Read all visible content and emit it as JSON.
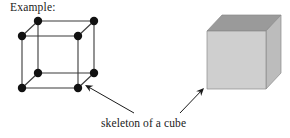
{
  "figure": {
    "background_color": "#ffffff",
    "heading": "Example:",
    "caption": "skeleton of a cube",
    "ink_color": "#1a1a1a"
  },
  "skeleton_cube": {
    "name": "skeleton of a cube",
    "vertex_count": 8,
    "edge_count": 12,
    "vertex_style": "filled-black-dot",
    "vertex_radius": 4.2,
    "edge_color": "#3a3a3a",
    "vertex_color": "#111111",
    "front_face": {
      "top_left": [
        22,
        36
      ],
      "top_right": [
        78,
        36
      ],
      "bottom_right": [
        78,
        88
      ],
      "bottom_left": [
        22,
        88
      ]
    },
    "back_face": {
      "top_left": [
        38,
        21
      ],
      "top_right": [
        94,
        21
      ],
      "bottom_right": [
        94,
        73
      ],
      "bottom_left": [
        38,
        73
      ]
    },
    "vertices": [
      [
        22,
        36
      ],
      [
        78,
        36
      ],
      [
        78,
        88
      ],
      [
        22,
        88
      ],
      [
        38,
        21
      ],
      [
        94,
        21
      ],
      [
        94,
        73
      ],
      [
        38,
        73
      ]
    ]
  },
  "solid_cube": {
    "name": "solid cube",
    "front_face_color": "#cfcfcf",
    "top_face_color": "#9a9a9a",
    "right_face_color": "#bcbcbc",
    "outline_color": "#8a8a8a",
    "front_face": {
      "top_left": [
        207,
        31
      ],
      "top_right": [
        266,
        31
      ],
      "bottom_right": [
        266,
        89
      ],
      "bottom_left": [
        207,
        89
      ]
    },
    "top_face": {
      "front_left": [
        207,
        31
      ],
      "back_left": [
        222,
        15
      ],
      "back_right": [
        281,
        15
      ],
      "front_right": [
        266,
        31
      ]
    },
    "right_face": {
      "front_top": [
        266,
        31
      ],
      "back_top": [
        281,
        15
      ],
      "back_bottom": [
        281,
        73
      ],
      "front_bottom": [
        266,
        89
      ]
    }
  },
  "arrows": [
    {
      "name": "arrow-to-skeleton",
      "from": [
        134,
        113
      ],
      "to": [
        85,
        85
      ],
      "color": "#1a1a1a"
    },
    {
      "name": "arrow-to-solid-cube",
      "from": [
        180,
        113
      ],
      "to": [
        204,
        88
      ],
      "color": "#1a1a1a"
    }
  ]
}
